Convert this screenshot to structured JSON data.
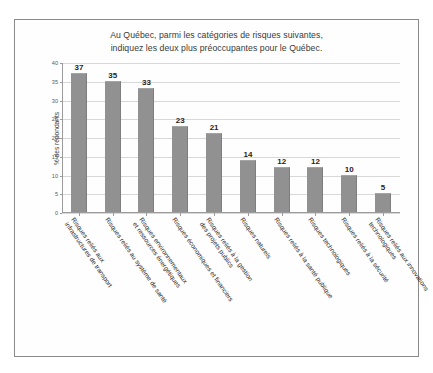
{
  "chart_data": {
    "type": "bar",
    "title": "Au Québec, parmi les catégories de risques suivantes, indiquez les deux plus préoccupantes pour le Québec.",
    "title_lines": [
      "Au Québec, parmi les catégories de risques suivantes,",
      "indiquez les deux plus préoccupantes pour le Québec."
    ],
    "xlabel": "",
    "ylabel": "% des répondants",
    "ylim": [
      0,
      40
    ],
    "yticks": [
      0,
      5,
      10,
      15,
      20,
      25,
      30,
      35,
      40
    ],
    "ytick_labels": [
      "0",
      "5",
      "10",
      "15",
      "20",
      "25",
      "30",
      "35",
      "40"
    ],
    "grid": true,
    "legend": false,
    "bar_color": "#919191",
    "categories": [
      "Risques reliés aux infrastructures de transport",
      "Risques reliés au système de santé",
      "Risques environnementaux et ressources énergétiques",
      "Risques économiques et financiers",
      "Risques reliés à la gestion des projets publics",
      "Risques naturels",
      "Risques reliés à la santé publique",
      "Risques technologiques",
      "Risques reliés à la sécurité",
      "Risques reliés aux innovations technologiques"
    ],
    "category_lines": [
      [
        "Risques reliés aux",
        "infrastructures de transport"
      ],
      [
        "Risques reliés au système de santé"
      ],
      [
        "Risques environnementaux",
        "et ressources énergétiques"
      ],
      [
        "Risques économiques et financiers"
      ],
      [
        "Risques reliés à la gestion",
        "des projets publics"
      ],
      [
        "Risques naturels"
      ],
      [
        "Risques reliés à la santé publique"
      ],
      [
        "Risques technologiques"
      ],
      [
        "Risques reliés à la sécurité"
      ],
      [
        "Risques reliés aux innovations",
        "technologiques"
      ]
    ],
    "values": [
      37,
      35,
      33,
      23,
      21,
      14,
      12,
      12,
      10,
      5
    ],
    "value_labels": [
      "37",
      "35",
      "33",
      "23",
      "21",
      "14",
      "12",
      "12",
      "10",
      "5"
    ]
  }
}
